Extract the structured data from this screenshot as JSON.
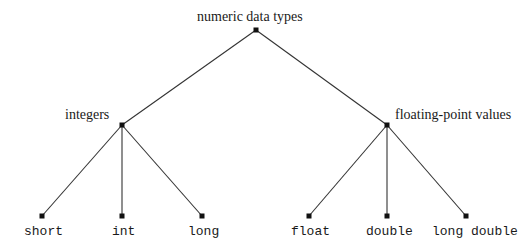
{
  "diagram": {
    "type": "tree",
    "root": {
      "label": "numeric data types",
      "x": 256,
      "y": 30
    },
    "categories": [
      {
        "label": "integers",
        "x": 122,
        "y": 125
      },
      {
        "label": "floating-point values",
        "x": 387,
        "y": 125
      }
    ],
    "leaves": [
      {
        "label": "short",
        "x": 42,
        "y": 216,
        "parent": 0
      },
      {
        "label": "int",
        "x": 122,
        "y": 216,
        "parent": 0
      },
      {
        "label": "long",
        "x": 202,
        "y": 216,
        "parent": 0
      },
      {
        "label": "float",
        "x": 309,
        "y": 216,
        "parent": 1
      },
      {
        "label": "double",
        "x": 387,
        "y": 216,
        "parent": 1
      },
      {
        "label": "long double",
        "x": 466,
        "y": 216,
        "parent": 1
      }
    ],
    "colors": {
      "line": "#333333",
      "node": "#111111",
      "text": "#1a1a1a",
      "background": "#ffffff"
    }
  }
}
